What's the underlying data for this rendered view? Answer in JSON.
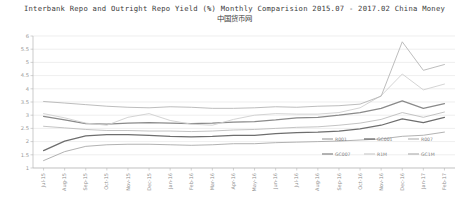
{
  "chart_data": {
    "type": "line",
    "title": "Interbank Repo and Outright Repo Yield (%) Monthly Comparision 2015.07 - 2017.02 China Money",
    "subtitle": "中国货币网",
    "xlabel": "",
    "ylabel": "",
    "ylim": [
      1,
      6
    ],
    "yticks": [
      1,
      1.5,
      2,
      2.5,
      3,
      3.5,
      4,
      4.5,
      5,
      5.5,
      6
    ],
    "ytick_labels": [
      "1",
      "1.5",
      "2",
      "2.5",
      "3",
      "3.5",
      "4",
      "4.5",
      "5",
      "5.5",
      "6"
    ],
    "grid": true,
    "legend_position": "bottom-right",
    "categories": [
      "Jul-15",
      "Aug-15",
      "Sep-15",
      "Oct-15",
      "Nov-15",
      "Dec-15",
      "Jan-16",
      "Feb-16",
      "Mar-16",
      "Apr-16",
      "May-16",
      "Jun-16",
      "Jul-16",
      "Aug-16",
      "Sep-16",
      "Oct-16",
      "Nov-16",
      "Dec-16",
      "Jan-17",
      "Feb-17"
    ],
    "series": [
      {
        "name": "R001",
        "color": "#a9a9a9",
        "width": 0.9,
        "values": [
          1.28,
          1.62,
          1.82,
          1.88,
          1.9,
          1.9,
          1.88,
          1.86,
          1.88,
          1.92,
          1.92,
          1.96,
          1.98,
          2.0,
          2.02,
          2.06,
          2.1,
          2.2,
          2.24,
          2.36
        ]
      },
      {
        "name": "GC001",
        "color": "#6e6e6e",
        "width": 1.25,
        "values": [
          1.66,
          2.02,
          2.22,
          2.26,
          2.26,
          2.24,
          2.2,
          2.18,
          2.2,
          2.24,
          2.24,
          2.3,
          2.34,
          2.36,
          2.4,
          2.48,
          2.62,
          2.86,
          2.72,
          2.92
        ]
      },
      {
        "name": "R007",
        "color": "#bdbdbd",
        "width": 0.9,
        "values": [
          2.58,
          2.52,
          2.46,
          2.42,
          2.42,
          2.4,
          2.4,
          2.38,
          2.4,
          2.44,
          2.46,
          2.5,
          2.54,
          2.56,
          2.62,
          2.7,
          2.84,
          3.1,
          2.92,
          3.12
        ]
      },
      {
        "name": "GC007",
        "color": "#8a8a8a",
        "width": 1.25,
        "values": [
          2.96,
          2.82,
          2.68,
          2.66,
          2.7,
          2.72,
          2.7,
          2.68,
          2.7,
          2.74,
          2.76,
          2.82,
          2.9,
          2.92,
          3.0,
          3.1,
          3.26,
          3.54,
          3.26,
          3.44
        ]
      },
      {
        "name": "R1M",
        "color": "#cfcfcf",
        "width": 0.9,
        "values": [
          3.06,
          2.9,
          2.7,
          2.62,
          2.92,
          3.06,
          2.8,
          2.66,
          2.62,
          2.84,
          3.0,
          3.06,
          3.04,
          3.04,
          3.1,
          3.28,
          3.74,
          4.56,
          3.96,
          4.18
        ]
      },
      {
        "name": "GC1M",
        "color": "#b6b6b6",
        "width": 0.9,
        "values": [
          3.52,
          3.46,
          3.4,
          3.34,
          3.3,
          3.28,
          3.32,
          3.3,
          3.26,
          3.26,
          3.28,
          3.32,
          3.3,
          3.34,
          3.36,
          3.42,
          3.72,
          5.78,
          4.7,
          4.92
        ]
      }
    ]
  },
  "axis": {
    "y_tick_labels": [
      "6",
      "5.5",
      "5",
      "4.5",
      "4",
      "3.5",
      "3",
      "2.5",
      "2",
      "1.5",
      "1"
    ],
    "x_tick_labels": [
      "Jul-15",
      "Aug-15",
      "Sep-15",
      "Oct-15",
      "Nov-15",
      "Dec-15",
      "Jan-16",
      "Feb-16",
      "Mar-16",
      "Apr-16",
      "May-16",
      "Jun-16",
      "Jul-16",
      "Aug-16",
      "Sep-16",
      "Oct-16",
      "Nov-16",
      "Dec-16",
      "Jan-17",
      "Feb-17"
    ]
  },
  "legend": {
    "row1": [
      {
        "label": "R001",
        "color": "#a9a9a9"
      },
      {
        "label": "GC001",
        "color": "#6e6e6e"
      },
      {
        "label": "R007",
        "color": "#bdbdbd"
      }
    ],
    "row2": [
      {
        "label": "GC007",
        "color": "#8a8a8a"
      },
      {
        "label": "R1M",
        "color": "#cfcfcf"
      },
      {
        "label": "GC1M",
        "color": "#b6b6b6"
      }
    ]
  }
}
